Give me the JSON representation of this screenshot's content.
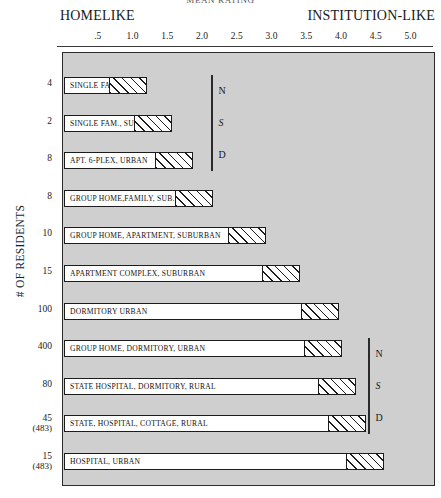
{
  "chart_data": {
    "type": "bar",
    "orientation": "horizontal",
    "title": "MEAN RATING",
    "xlabel": "",
    "ylabel": "# OF RESIDENTS",
    "pole_left": "HOMELIKE",
    "pole_right": "INSTITUTION-LIKE",
    "xlim": [
      0,
      5.4
    ],
    "xticks": [
      0.5,
      1.0,
      1.5,
      2.0,
      2.5,
      3.0,
      3.5,
      4.0,
      4.5,
      5.0
    ],
    "xtick_labels": [
      ".5",
      "1.0",
      "1.5",
      "2.0",
      "2.5",
      "3.0",
      "3.5",
      "4.0",
      "4.5",
      "5.0"
    ],
    "grid": false,
    "legend": null,
    "categories": [
      "SINGLE FAM., URB.",
      "SINGLE FAM., SUB.",
      "APT. 6-PLEX, URBAN",
      "GROUP HOME,FAMILY, SUB.",
      "GROUP HOME, APARTMENT, SUBURBAN",
      "APARTMENT COMPLEX, SUBURBAN",
      "DORMITORY URBAN",
      "GROUP HOME, DORMITORY, URBAN",
      "STATE HOSPITAL, DORMITORY, RURAL",
      "STATE, HOSPITAL, COTTAGE, RURAL",
      "HOSPITAL, URBAN"
    ],
    "residents": [
      "4",
      "2",
      "8",
      "8",
      "10",
      "15",
      "100",
      "400",
      "80",
      "45",
      "15"
    ],
    "residents_sub": [
      "",
      "",
      "",
      "",
      "",
      "",
      "",
      "",
      "",
      "(483)",
      "(483)"
    ],
    "values": [
      1.2,
      1.55,
      1.85,
      2.15,
      2.9,
      3.4,
      3.95,
      4.0,
      4.2,
      4.35,
      4.6
    ],
    "annotations": [
      {
        "label_lines": [
          "N",
          "S",
          "D"
        ],
        "covers_rows": [
          0,
          1,
          2
        ]
      },
      {
        "label_lines": [
          "N",
          "S",
          "D"
        ],
        "covers_rows": [
          7,
          8,
          9
        ]
      }
    ]
  }
}
